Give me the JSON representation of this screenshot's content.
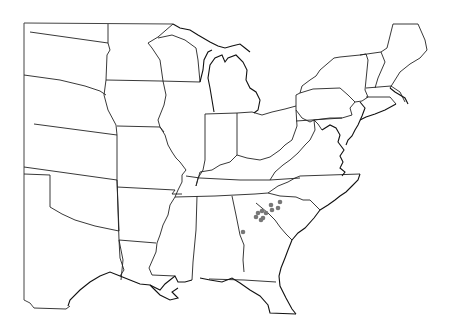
{
  "map": {
    "title": "",
    "region": "Eastern United States",
    "background_color": "#ffffff",
    "boundary_color": "#222222",
    "marker_color": "#777777",
    "markers": [
      {
        "x": 280,
        "y": 202,
        "r": 2.3
      },
      {
        "x": 278,
        "y": 208,
        "r": 2.3
      },
      {
        "x": 271,
        "y": 205,
        "r": 2.3
      },
      {
        "x": 272,
        "y": 210,
        "r": 2.3
      },
      {
        "x": 266,
        "y": 213,
        "r": 2.3
      },
      {
        "x": 262,
        "y": 211,
        "r": 2.3
      },
      {
        "x": 258,
        "y": 213,
        "r": 2.3
      },
      {
        "x": 256,
        "y": 217,
        "r": 2.3
      },
      {
        "x": 261,
        "y": 220,
        "r": 2.3
      },
      {
        "x": 263,
        "y": 218,
        "r": 2.3
      },
      {
        "x": 243,
        "y": 232,
        "r": 2.3
      }
    ]
  }
}
